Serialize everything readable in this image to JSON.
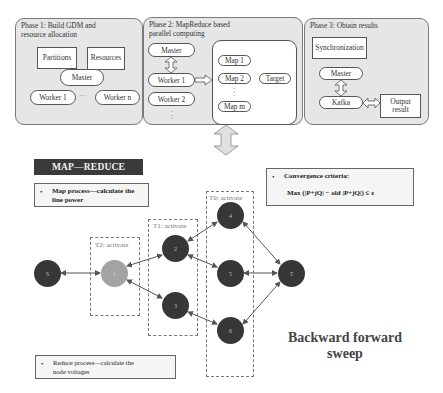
{
  "phases": [
    {
      "title": "Phase 1: Build GDM and\nresource allocation",
      "boxes": [
        "Partitions",
        "Resources"
      ],
      "master": "Master",
      "workers": [
        "Worker 1",
        "Worker n"
      ],
      "ellipsis": "···"
    },
    {
      "title": "Phase 2: MapReduce based\nparallel computing",
      "master": "Master",
      "workers": [
        "Worker 1",
        "Worker 2"
      ],
      "maps": [
        "Map 1",
        "Map 2",
        "Map m"
      ],
      "target": "Target"
    },
    {
      "title": "Phase 3: Obtain results",
      "sync": "Synchronization",
      "master": "Master",
      "kafka": "Kafka",
      "output": "Output\nresult"
    }
  ],
  "mapreduce": {
    "title": "MAP—REDUCE",
    "map_note": "Map process—calculate the\nline power",
    "reduce_note": "Reduce process—calculate the\nnode voltages",
    "bullet": "•"
  },
  "convergence": {
    "label": "Convergence criteria:",
    "formula": "Max (|P+jQ| − old |P+jQ|) ≤ ε"
  },
  "activation_groups": [
    {
      "label": "T2: activate"
    },
    {
      "label": "T1: activate"
    },
    {
      "label": "T0: activate"
    }
  ],
  "nodes": [
    {
      "id": "S",
      "label": "S"
    },
    {
      "id": "1",
      "label": "1"
    },
    {
      "id": "2",
      "label": "2"
    },
    {
      "id": "3",
      "label": "3"
    },
    {
      "id": "4",
      "label": "4"
    },
    {
      "id": "5",
      "label": "5"
    },
    {
      "id": "6",
      "label": "6"
    },
    {
      "id": "T",
      "label": "T"
    }
  ],
  "edges": [
    [
      "S",
      "1"
    ],
    [
      "1",
      "2"
    ],
    [
      "1",
      "3"
    ],
    [
      "2",
      "4"
    ],
    [
      "2",
      "5"
    ],
    [
      "3",
      "6"
    ],
    [
      "4",
      "T"
    ],
    [
      "5",
      "T"
    ],
    [
      "6",
      "T"
    ]
  ],
  "method_label": "Backward forward\nsweep",
  "colors": {
    "phase_bg": "#e6e6e6",
    "node_dark": "#373737",
    "node_light": "#a3a3a3",
    "title_bar": "#3a3a3a"
  }
}
